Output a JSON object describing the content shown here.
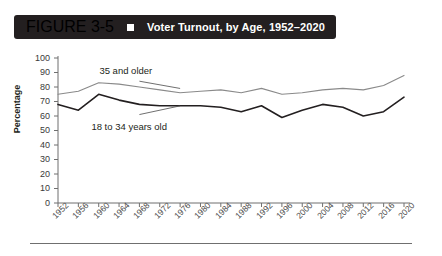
{
  "header": {
    "figure_number": "FIGURE 3-5",
    "bullet_icon": "square-bullet-icon",
    "title": "Voter Turnout, by Age, 1952–2020",
    "bar_color": "#231f20",
    "text_color": "#ffffff"
  },
  "chart_data": {
    "type": "line",
    "title": "Voter Turnout, by Age, 1952–2020",
    "xlabel": "",
    "ylabel": "Percentage",
    "ylim": [
      0,
      100
    ],
    "ytick_step": 10,
    "yticks": [
      "100",
      "90",
      "80",
      "70",
      "60",
      "50",
      "40",
      "30",
      "20",
      "10",
      "0"
    ],
    "grid": false,
    "legend_position": "inline-annotations",
    "categories": [
      "1952",
      "1956",
      "1960",
      "1964",
      "1968",
      "1972",
      "1976",
      "1980",
      "1984",
      "1988",
      "1992",
      "1996",
      "2000",
      "2004",
      "2008",
      "2012",
      "2016",
      "2020"
    ],
    "series": [
      {
        "name": "35 and older",
        "color": "#8a8a8a",
        "line_width": 1.1,
        "values": [
          75,
          77,
          83,
          82,
          80,
          78,
          76,
          77,
          78,
          76,
          79,
          75,
          76,
          78,
          79,
          78,
          81,
          88
        ]
      },
      {
        "name": "18 to 34 years old",
        "color": "#231f20",
        "line_width": 1.6,
        "values": [
          68,
          64,
          75,
          71,
          68,
          67,
          67,
          67,
          66,
          63,
          67,
          59,
          64,
          68,
          66,
          60,
          63,
          73
        ]
      }
    ],
    "annotations": [
      {
        "text": "35 and older",
        "series": "35 and older",
        "leader_from": [
          1968,
          84
        ],
        "leader_to": [
          1976,
          79
        ]
      },
      {
        "text": "18 to 34 years old",
        "series": "18 to 34 years old",
        "leader_from": [
          1968,
          61
        ],
        "leader_to": [
          1976,
          67
        ]
      }
    ]
  }
}
